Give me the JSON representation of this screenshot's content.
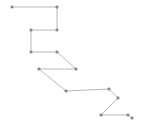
{
  "figure": {
    "background_color": "#ffffff",
    "width": 145,
    "height": 129,
    "title": "",
    "axes_visible": false,
    "grid_visible": false,
    "legend_visible": false
  },
  "chart_data": {
    "type": "line",
    "title": "",
    "xlabel": "",
    "ylabel": "",
    "xlim": [
      0,
      145
    ],
    "ylim": [
      0,
      129
    ],
    "grid": false,
    "legend": false,
    "axes": false,
    "marker": "square",
    "marker_size": 2.2,
    "line_color": "#9a9a9a",
    "marker_color": "#8a8a8a",
    "line_width": 0.7,
    "series": [
      {
        "name": "polyline",
        "points": [
          [
            12,
            7
          ],
          [
            57,
            7
          ],
          [
            57,
            30
          ],
          [
            31,
            30
          ],
          [
            31,
            52
          ],
          [
            57,
            52
          ],
          [
            76,
            69
          ],
          [
            39,
            69
          ],
          [
            66,
            91
          ],
          [
            109,
            89
          ],
          [
            118,
            98
          ],
          [
            101,
            115
          ],
          [
            128,
            115
          ],
          [
            132,
            118
          ]
        ],
        "x": [
          12,
          57,
          57,
          31,
          31,
          57,
          76,
          39,
          66,
          109,
          118,
          101,
          128,
          132
        ],
        "y": [
          7,
          7,
          30,
          30,
          52,
          52,
          69,
          69,
          91,
          89,
          98,
          115,
          115,
          118
        ]
      }
    ]
  }
}
